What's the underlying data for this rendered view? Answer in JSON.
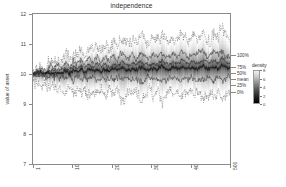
{
  "chart_data": {
    "type": "area",
    "title": "independence",
    "xlabel": "",
    "ylabel": "value of asset",
    "xlim": [
      1,
      500
    ],
    "ylim": [
      7,
      12
    ],
    "grid": false,
    "x_ticks": [
      "1",
      "100",
      "200",
      "300",
      "400",
      "500"
    ],
    "x_tick_values": [
      1,
      100,
      200,
      300,
      400,
      500
    ],
    "y_ticks": [
      "7",
      "8",
      "9",
      "10",
      "11",
      "12"
    ],
    "y_tick_values": [
      7,
      8,
      9,
      10,
      11,
      12
    ],
    "legend_position": "right",
    "quantile_labels": [
      "100%",
      "75%",
      "50%",
      "mean",
      "25%",
      "0%"
    ],
    "quantile_end_values": [
      10.62,
      10.24,
      10.12,
      10.06,
      9.92,
      9.4
    ],
    "series": [
      {
        "name": "100%",
        "values": [
          10.05,
          10.22,
          10.35,
          10.18,
          10.44,
          10.3,
          10.52,
          10.41,
          10.62,
          10.48,
          10.7,
          10.55,
          10.82,
          10.64,
          10.9,
          10.72,
          11.02,
          10.84,
          10.95,
          10.78,
          11.1,
          10.92,
          11.22,
          11.04,
          10.96,
          11.18,
          11.0,
          11.3,
          11.12,
          10.98,
          11.24,
          11.06,
          11.34,
          11.16,
          11.02,
          11.28,
          11.1,
          11.4,
          11.2,
          11.05,
          11.32,
          11.14,
          11.44,
          11.24,
          11.08,
          11.36,
          11.18,
          11.48,
          11.28,
          11.12
        ]
      },
      {
        "name": "75%",
        "values": [
          10.02,
          10.12,
          10.2,
          10.1,
          10.26,
          10.18,
          10.32,
          10.24,
          10.38,
          10.28,
          10.42,
          10.32,
          10.48,
          10.36,
          10.52,
          10.4,
          10.58,
          10.46,
          10.54,
          10.44,
          10.62,
          10.5,
          10.68,
          10.56,
          10.52,
          10.64,
          10.54,
          10.72,
          10.6,
          10.54,
          10.68,
          10.58,
          10.74,
          10.62,
          10.56,
          10.7,
          10.6,
          10.76,
          10.64,
          10.58,
          10.72,
          10.62,
          10.78,
          10.66,
          10.6,
          10.74,
          10.64,
          10.8,
          10.68,
          10.62
        ]
      },
      {
        "name": "50%",
        "values": [
          10.0,
          10.06,
          10.1,
          10.04,
          10.14,
          10.08,
          10.18,
          10.12,
          10.22,
          10.14,
          10.24,
          10.16,
          10.28,
          10.18,
          10.3,
          10.2,
          10.34,
          10.24,
          10.3,
          10.22,
          10.36,
          10.26,
          10.4,
          10.3,
          10.28,
          10.36,
          10.3,
          10.42,
          10.34,
          10.3,
          10.38,
          10.32,
          10.44,
          10.36,
          10.32,
          10.4,
          10.34,
          10.46,
          10.38,
          10.34,
          10.42,
          10.36,
          10.48,
          10.4,
          10.36,
          10.44,
          10.38,
          10.5,
          10.42,
          10.38
        ]
      },
      {
        "name": "mean",
        "values": [
          10.0,
          10.02,
          10.04,
          10.0,
          10.06,
          10.02,
          10.08,
          10.04,
          10.1,
          10.05,
          10.12,
          10.06,
          10.14,
          10.07,
          10.15,
          10.08,
          10.18,
          10.1,
          10.14,
          10.09,
          10.2,
          10.12,
          10.22,
          10.14,
          10.13,
          10.19,
          10.14,
          10.24,
          10.17,
          10.14,
          10.2,
          10.16,
          10.25,
          10.18,
          10.15,
          10.21,
          10.17,
          10.26,
          10.19,
          10.16,
          10.22,
          10.18,
          10.27,
          10.2,
          10.17,
          10.23,
          10.19,
          10.28,
          10.21,
          10.18
        ]
      },
      {
        "name": "25%",
        "values": [
          9.98,
          9.94,
          9.9,
          9.96,
          9.88,
          9.94,
          9.86,
          9.92,
          9.84,
          9.92,
          9.84,
          9.92,
          9.82,
          9.9,
          9.82,
          9.9,
          9.8,
          9.88,
          9.84,
          9.9,
          9.8,
          9.88,
          9.78,
          9.86,
          9.88,
          9.82,
          9.86,
          9.78,
          9.84,
          9.88,
          9.82,
          9.86,
          9.78,
          9.84,
          9.88,
          9.82,
          9.86,
          9.78,
          9.84,
          9.88,
          9.82,
          9.86,
          9.78,
          9.84,
          9.88,
          9.82,
          9.86,
          9.78,
          9.84,
          9.88
        ]
      },
      {
        "name": "0%",
        "values": [
          9.95,
          9.72,
          9.58,
          9.76,
          9.5,
          9.68,
          9.44,
          9.6,
          9.38,
          9.58,
          9.36,
          9.56,
          9.3,
          9.52,
          9.28,
          9.5,
          9.22,
          9.46,
          9.34,
          9.54,
          9.24,
          9.48,
          9.18,
          9.42,
          9.5,
          9.3,
          9.46,
          9.16,
          9.38,
          9.48,
          9.28,
          9.44,
          9.14,
          9.36,
          9.46,
          9.26,
          9.42,
          9.12,
          9.34,
          9.44,
          9.24,
          9.4,
          9.1,
          9.32,
          9.42,
          9.22,
          9.38,
          9.08,
          9.3,
          9.4
        ]
      }
    ],
    "density_legend": {
      "title": "density",
      "ticks": [
        "0",
        "2",
        "4",
        "6",
        "8"
      ],
      "tick_values": [
        0,
        2,
        4,
        6,
        8
      ],
      "colormap": "greyscale",
      "low_color": "#ffffff",
      "high_color": "#000000"
    }
  }
}
